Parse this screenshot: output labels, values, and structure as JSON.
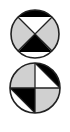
{
  "figure": {
    "colors": {
      "black": "#000000",
      "gray": "#d0d0d0",
      "white": "#ffffff",
      "outline": "#222222"
    },
    "symbols": [
      {
        "name": "top-circle",
        "cx": 35,
        "cy": 34,
        "r": 24,
        "pattern": "X-divided: black top cap, white top triangle, gray left/right, black bottom triangle, white bottom cap"
      },
      {
        "name": "bottom-circle",
        "cx": 35,
        "cy": 88,
        "r": 25,
        "pattern": "Plus-divided quadrants: gray top-left, top-right white triangle with black outer segment, bottom-left black triangle with white outer segment, gray bottom-right"
      }
    ]
  }
}
